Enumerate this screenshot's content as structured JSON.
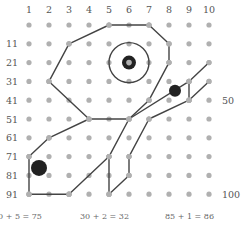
{
  "grid": {
    "col_labels": [
      "1",
      "2",
      "3",
      "4",
      "5",
      "6",
      "7",
      "8",
      "9",
      "10"
    ],
    "row_labels": [
      "",
      "11",
      "21",
      "31",
      "41",
      "51",
      "61",
      "71",
      "81",
      "91"
    ],
    "right_labels": [
      {
        "row": 4,
        "text": "50"
      },
      {
        "row": 9,
        "text": "100"
      }
    ],
    "dot_color": "#b0b0b0",
    "line_color": "#444444"
  },
  "segments": [
    [
      [
        5,
        0
      ],
      [
        7,
        0
      ]
    ],
    [
      [
        7,
        0
      ],
      [
        8,
        1
      ]
    ],
    [
      [
        8,
        1
      ],
      [
        8,
        2
      ]
    ],
    [
      [
        8,
        2
      ],
      [
        7,
        4
      ]
    ],
    [
      [
        7,
        4
      ],
      [
        6,
        5
      ]
    ],
    [
      [
        6,
        5
      ],
      [
        5,
        7
      ]
    ],
    [
      [
        5,
        0
      ],
      [
        3,
        1
      ]
    ],
    [
      [
        3,
        1
      ],
      [
        2,
        3
      ]
    ],
    [
      [
        2,
        3
      ],
      [
        4,
        5
      ]
    ],
    [
      [
        4,
        5
      ],
      [
        6,
        5
      ]
    ],
    [
      [
        4,
        5
      ],
      [
        2,
        6
      ]
    ],
    [
      [
        2,
        6
      ],
      [
        1,
        7
      ]
    ],
    [
      [
        1,
        7
      ],
      [
        1,
        9
      ]
    ],
    [
      [
        1,
        9
      ],
      [
        3,
        9
      ]
    ],
    [
      [
        3,
        9
      ],
      [
        5,
        7
      ]
    ],
    [
      [
        5,
        7
      ],
      [
        5,
        9
      ]
    ],
    [
      [
        5,
        9
      ],
      [
        6,
        8
      ]
    ],
    [
      [
        6,
        8
      ],
      [
        6,
        7
      ]
    ],
    [
      [
        6,
        7
      ],
      [
        7,
        5
      ]
    ],
    [
      [
        6,
        5
      ],
      [
        9,
        3
      ]
    ],
    [
      [
        9,
        3
      ],
      [
        10,
        2
      ]
    ],
    [
      [
        9,
        3
      ],
      [
        9,
        4
      ]
    ],
    [
      [
        7,
        5
      ],
      [
        9,
        4
      ]
    ],
    [
      [
        9,
        4
      ],
      [
        10,
        3
      ]
    ]
  ],
  "circle": {
    "center": [
      6,
      2
    ],
    "radius": 20
  },
  "markers": [
    {
      "at": [
        6,
        2
      ],
      "r": 7,
      "hollow_center": true
    },
    {
      "at": [
        8.3,
        3.5
      ],
      "r": 6
    },
    {
      "at": [
        1.5,
        7.6
      ],
      "r": 8
    }
  ],
  "equations": [
    "0 + 5 = 75",
    "30 + 2 = 32",
    "85 + 1 = 86"
  ]
}
